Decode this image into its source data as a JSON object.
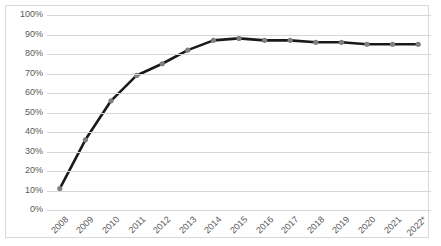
{
  "title_strip": {
    "clipped_text": ""
  },
  "chart_data": {
    "type": "line",
    "title": "",
    "subtitle": "",
    "xlabel": "",
    "ylabel": "",
    "categories": [
      "2008",
      "2009",
      "2010",
      "2011",
      "2012",
      "2013",
      "2014",
      "2015",
      "2016",
      "2017",
      "2018",
      "2019",
      "2020",
      "2021",
      "2022*"
    ],
    "values": [
      11,
      36,
      56,
      69,
      75,
      82,
      87,
      88,
      87,
      87,
      86,
      86,
      85,
      85,
      85
    ],
    "value_suffix": "%",
    "ylim": [
      0,
      100
    ],
    "ytick_values": [
      0,
      10,
      20,
      30,
      40,
      50,
      60,
      70,
      80,
      90,
      100
    ],
    "ytick_labels": [
      "0%",
      "10%",
      "20%",
      "30%",
      "40%",
      "50%",
      "60%",
      "70%",
      "80%",
      "90%",
      "100%"
    ],
    "grid": true,
    "grid_axis": "y",
    "legend": false,
    "legend_position": "none",
    "series": [
      {
        "name": "",
        "values": [
          11,
          36,
          56,
          69,
          75,
          82,
          87,
          88,
          87,
          87,
          86,
          86,
          85,
          85,
          85
        ],
        "line_color": "#1a1a1a",
        "marker_color": "#808080",
        "marker_shape": "circle"
      }
    ],
    "annotations": [
      {
        "text": "2022*",
        "note": "asterisk indicates projected/estimated value"
      }
    ],
    "colors": {
      "line": "#1a1a1a",
      "marker": "#808080",
      "gridline": "#d6d6d6",
      "axis_text": "#595959",
      "frame": "#d9d9d9",
      "background": "#ffffff"
    }
  }
}
